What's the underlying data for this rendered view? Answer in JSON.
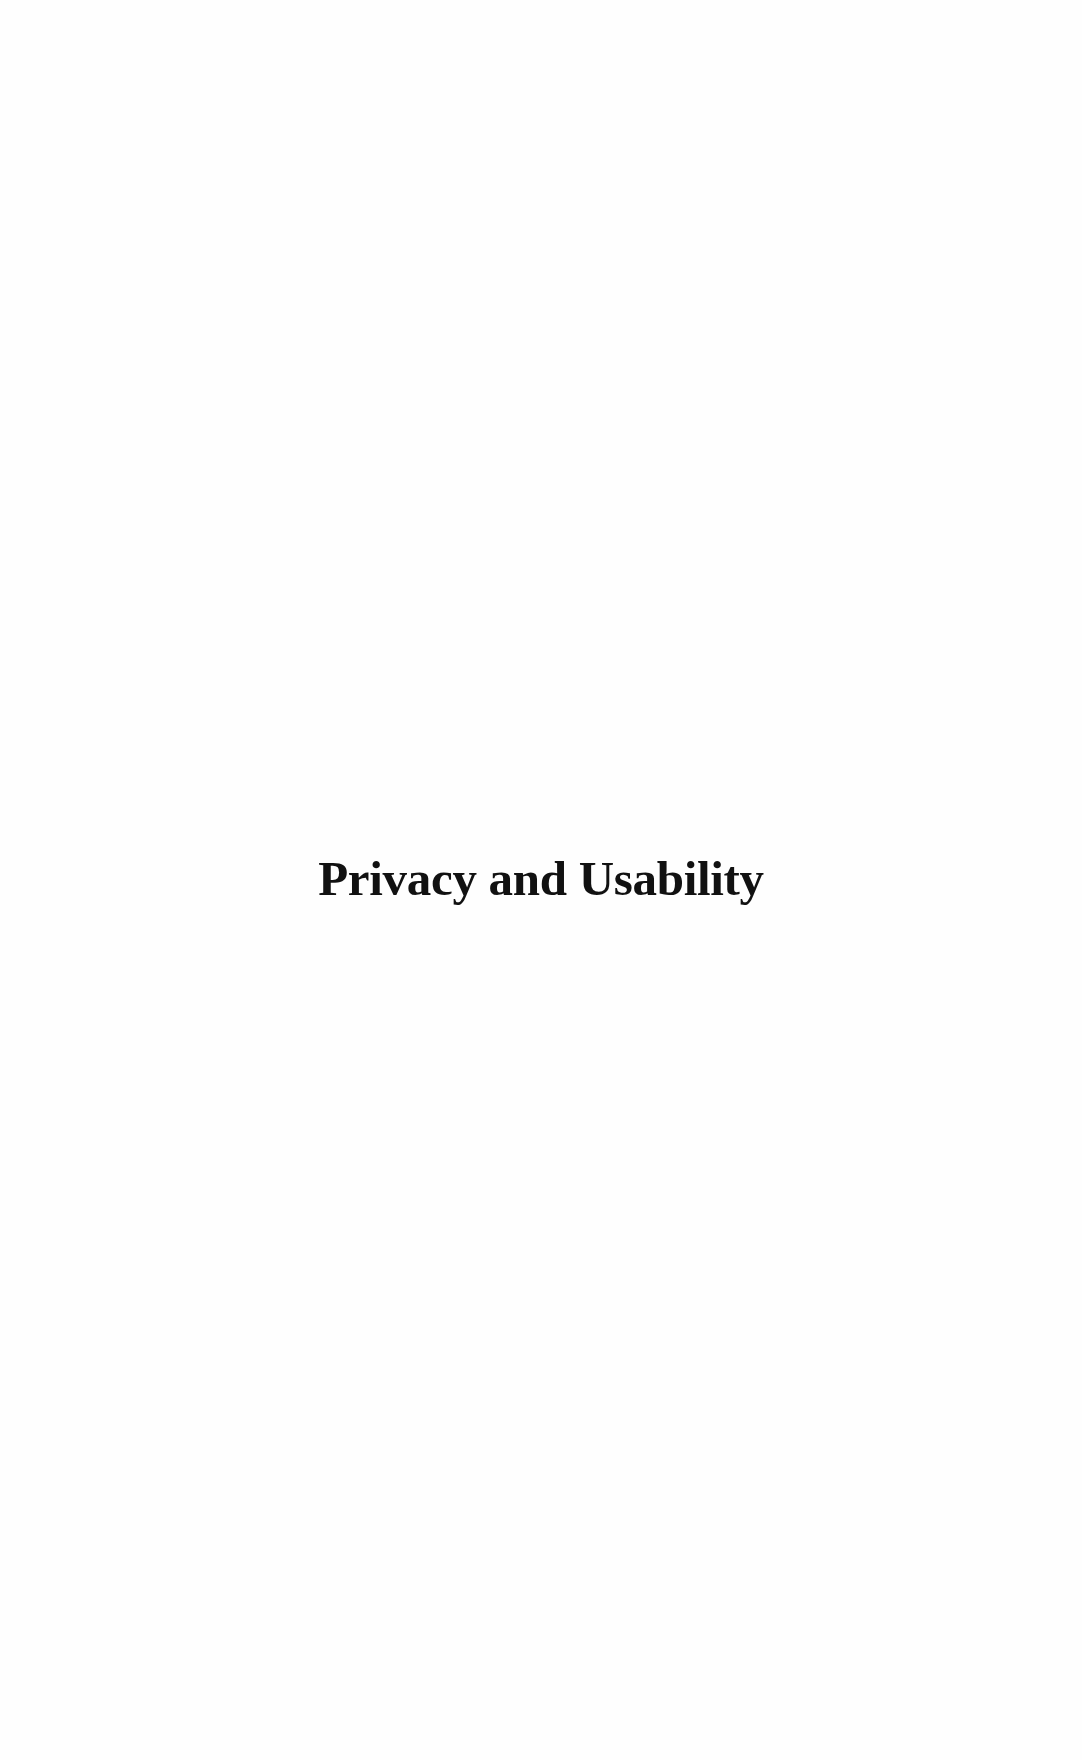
{
  "document": {
    "title": "Privacy and Usability"
  },
  "colors": {
    "background": "#fefefe",
    "text": "#111111"
  }
}
